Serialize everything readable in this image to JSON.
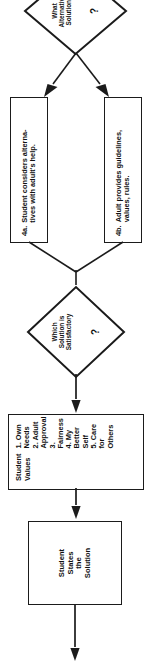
{
  "diagram": {
    "orientation": "rotated-90",
    "line_color": "#1b1b1b",
    "fill_color": "#ffffff",
    "text_color": "#111111"
  },
  "nodes": {
    "entry_arrow": {
      "name": "entry-flow-line"
    },
    "question_alternatives": {
      "label": "What\nAlternative\nSolutions",
      "marker": "?"
    },
    "step_4a": {
      "number": "4a.",
      "text": "Student considers alterna-\ntives with  adult's help."
    },
    "step_4b": {
      "number": "4b.",
      "text": "Adult provides guidelines,\nvalues, rules."
    },
    "question_satisfactory": {
      "label": "Which\nSolution is\nSatisfactory",
      "marker": "?"
    },
    "student_values": {
      "heading": "Student\nValues",
      "items": [
        "1. Own Needs",
        "2. Adult\n    Approval",
        "3. Fairness",
        "4. My Better\n    Self",
        "5. Care for\n    Others"
      ]
    },
    "student_states_solution": {
      "text": "Student\nStates\nthe\nSolution"
    },
    "exit_arrow": {
      "name": "exit-flow-arrow"
    }
  }
}
